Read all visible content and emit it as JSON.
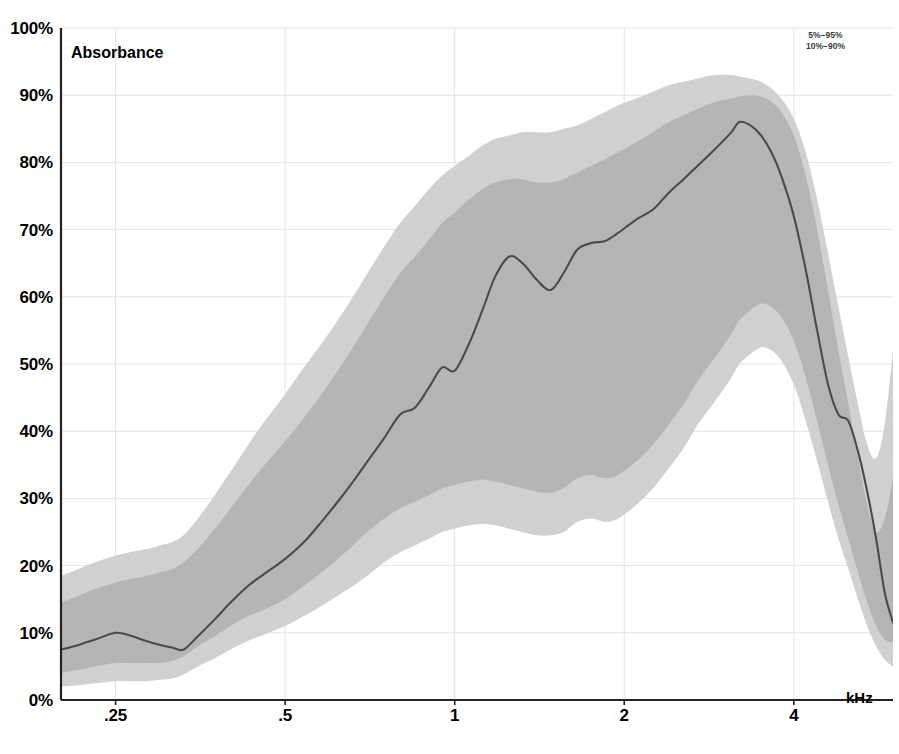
{
  "chart_data": {
    "type": "line",
    "title": "",
    "subtitle": "",
    "ylabel": "Absorbance",
    "xlabel": "kHz",
    "xscale": "log",
    "xlim": [
      0.2,
      6.0
    ],
    "ylim": [
      0,
      100
    ],
    "grid": true,
    "xticks": [
      0.25,
      0.5,
      1,
      2,
      4
    ],
    "xtick_labels": [
      ".25",
      ".5",
      "1",
      "2",
      "4"
    ],
    "yticks": [
      0,
      10,
      20,
      30,
      40,
      50,
      60,
      70,
      80,
      90,
      100
    ],
    "ytick_labels": [
      "0%",
      "10%",
      "20%",
      "30%",
      "40%",
      "50%",
      "60%",
      "70%",
      "80%",
      "90%",
      "100%"
    ],
    "legend_position": "top-right",
    "legend": [
      {
        "label": "5%−95%",
        "band": "outer",
        "color": "#d2d2d2"
      },
      {
        "label": "10%−90%",
        "band": "inner",
        "color": "#b4b4b4"
      }
    ],
    "annotations": [
      {
        "text": "Absorbance",
        "position": "inside-top-left"
      },
      {
        "text": "kHz",
        "position": "inside-bottom-right"
      }
    ],
    "x": [
      0.2,
      0.215,
      0.23,
      0.25,
      0.265,
      0.285,
      0.3,
      0.315,
      0.33,
      0.35,
      0.375,
      0.4,
      0.43,
      0.46,
      0.5,
      0.54,
      0.58,
      0.62,
      0.66,
      0.7,
      0.75,
      0.8,
      0.85,
      0.9,
      0.95,
      1.0,
      1.06,
      1.12,
      1.18,
      1.25,
      1.32,
      1.4,
      1.48,
      1.56,
      1.65,
      1.75,
      1.85,
      1.95,
      2.1,
      2.25,
      2.4,
      2.55,
      2.7,
      2.9,
      3.1,
      3.2,
      3.35,
      3.5,
      3.65,
      3.8,
      4.0,
      4.2,
      4.4,
      4.6,
      4.8,
      5.0,
      5.2,
      5.4,
      5.6,
      5.8,
      6.0
    ],
    "series": [
      {
        "name": "median",
        "role": "center-line",
        "color": "#4a4a4a",
        "values": [
          7.5,
          8.2,
          9.0,
          10.0,
          9.6,
          8.7,
          8.2,
          7.8,
          7.5,
          9.5,
          12.0,
          14.5,
          17.0,
          18.8,
          21.0,
          23.5,
          26.5,
          29.5,
          32.5,
          35.5,
          39.0,
          42.5,
          43.5,
          46.5,
          49.5,
          49.0,
          53.0,
          58.0,
          63.0,
          66.0,
          65.0,
          62.5,
          61.0,
          63.5,
          67.0,
          68.0,
          68.3,
          69.5,
          71.5,
          73.0,
          75.5,
          77.5,
          79.5,
          82.0,
          84.5,
          86.0,
          85.5,
          84.0,
          81.5,
          78.0,
          72.0,
          64.0,
          55.0,
          47.0,
          42.5,
          41.5,
          37.0,
          31.0,
          24.0,
          16.0,
          11.5
        ]
      },
      {
        "name": "10%−90%",
        "role": "inner-band",
        "color": "#b4b4b4",
        "lower": [
          4.0,
          4.5,
          5.0,
          5.5,
          5.5,
          5.5,
          5.5,
          5.8,
          6.5,
          8.0,
          9.5,
          11.0,
          12.5,
          13.5,
          15.0,
          17.0,
          19.0,
          21.0,
          23.0,
          25.0,
          27.0,
          28.5,
          29.5,
          30.5,
          31.5,
          32.0,
          32.5,
          32.8,
          32.5,
          32.0,
          31.5,
          31.0,
          30.8,
          31.5,
          33.0,
          33.5,
          33.0,
          33.5,
          35.5,
          38.0,
          41.0,
          44.0,
          47.5,
          51.0,
          54.5,
          56.5,
          58.0,
          59.0,
          58.5,
          57.0,
          53.5,
          48.0,
          41.5,
          35.0,
          29.0,
          24.0,
          19.0,
          14.5,
          11.0,
          9.0,
          8.5
        ],
        "upper": [
          14.5,
          15.5,
          16.5,
          17.5,
          18.0,
          18.5,
          19.0,
          19.5,
          20.5,
          22.5,
          25.5,
          28.5,
          32.0,
          35.0,
          38.5,
          42.0,
          45.5,
          49.0,
          52.5,
          56.0,
          60.0,
          63.5,
          66.0,
          68.5,
          71.0,
          72.5,
          74.5,
          76.0,
          77.0,
          77.5,
          77.5,
          77.0,
          77.0,
          77.5,
          78.5,
          79.5,
          80.5,
          81.5,
          83.0,
          84.5,
          86.0,
          87.0,
          88.0,
          89.0,
          89.5,
          89.8,
          90.0,
          89.8,
          89.0,
          87.5,
          84.0,
          78.0,
          70.0,
          61.0,
          52.0,
          44.0,
          36.0,
          29.0,
          25.0,
          27.0,
          33.0
        ]
      },
      {
        "name": "5%−95%",
        "role": "outer-band",
        "color": "#d2d2d2",
        "lower": [
          2.0,
          2.2,
          2.5,
          2.8,
          2.8,
          2.8,
          3.0,
          3.2,
          3.8,
          5.0,
          6.2,
          7.5,
          8.8,
          9.8,
          11.0,
          12.5,
          14.0,
          15.5,
          17.0,
          18.5,
          20.5,
          22.0,
          23.0,
          24.0,
          25.0,
          25.5,
          26.0,
          26.2,
          26.0,
          25.5,
          25.0,
          24.5,
          24.5,
          25.0,
          26.5,
          27.0,
          26.5,
          27.0,
          29.0,
          31.5,
          34.5,
          37.5,
          41.0,
          44.5,
          48.0,
          50.0,
          51.5,
          52.5,
          52.0,
          50.5,
          47.0,
          41.5,
          35.5,
          29.5,
          24.0,
          19.5,
          15.0,
          11.0,
          8.0,
          6.0,
          5.0
        ],
        "upper": [
          18.5,
          19.5,
          20.5,
          21.5,
          22.0,
          22.5,
          23.0,
          23.5,
          24.5,
          27.0,
          30.5,
          34.0,
          38.0,
          41.5,
          45.5,
          49.5,
          53.0,
          56.5,
          60.0,
          63.5,
          67.5,
          71.0,
          73.5,
          76.0,
          78.0,
          79.5,
          81.0,
          82.5,
          83.5,
          84.0,
          84.5,
          84.5,
          84.5,
          85.0,
          85.5,
          86.5,
          87.5,
          88.5,
          89.5,
          90.5,
          91.5,
          92.0,
          92.5,
          93.0,
          93.0,
          92.8,
          92.5,
          92.0,
          91.0,
          89.5,
          86.5,
          81.5,
          74.5,
          66.5,
          58.5,
          51.0,
          44.0,
          38.0,
          36.0,
          41.0,
          52.0
        ]
      }
    ]
  }
}
